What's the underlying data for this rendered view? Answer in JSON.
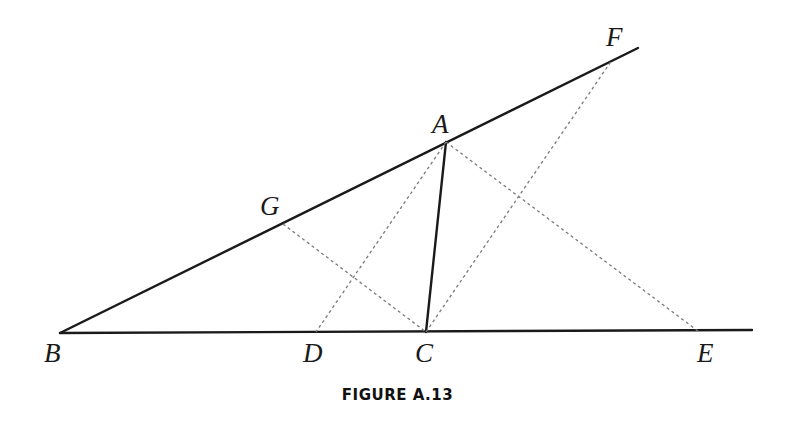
{
  "figure": {
    "caption": "FIGURE A.13",
    "points": {
      "A": {
        "label": "A",
        "x": 446,
        "y": 142,
        "lx": 432,
        "ly": 133
      },
      "B": {
        "label": "B",
        "x": 60,
        "y": 333,
        "lx": 44,
        "ly": 362
      },
      "C": {
        "label": "C",
        "x": 426,
        "y": 332,
        "lx": 415,
        "ly": 362
      },
      "D": {
        "label": "D",
        "x": 316,
        "y": 332,
        "lx": 303,
        "ly": 362
      },
      "E": {
        "label": "E",
        "x": 698,
        "y": 331,
        "lx": 697,
        "ly": 362
      },
      "F": {
        "label": "F",
        "x": 612,
        "y": 60,
        "lx": 606,
        "ly": 46
      },
      "G": {
        "label": "G",
        "x": 283,
        "y": 224,
        "lx": 260,
        "ly": 215
      }
    },
    "solid_lines": [
      {
        "name": "line-BF",
        "from": "B",
        "x1": 60,
        "y1": 333,
        "x2": 638,
        "y2": 48
      },
      {
        "name": "line-BE-extended",
        "from": "B",
        "x1": 60,
        "y1": 333,
        "x2": 752,
        "y2": 330
      },
      {
        "name": "segment-AC",
        "x1": 446,
        "y1": 142,
        "x2": 426,
        "y2": 332
      }
    ],
    "dashed_lines": [
      {
        "name": "segment-AD",
        "x1": 446,
        "y1": 142,
        "x2": 316,
        "y2": 332
      },
      {
        "name": "segment-AE",
        "x1": 446,
        "y1": 142,
        "x2": 698,
        "y2": 331
      },
      {
        "name": "segment-CF",
        "x1": 426,
        "y1": 332,
        "x2": 612,
        "y2": 60
      },
      {
        "name": "segment-GC",
        "x1": 283,
        "y1": 224,
        "x2": 426,
        "y2": 332
      }
    ]
  }
}
